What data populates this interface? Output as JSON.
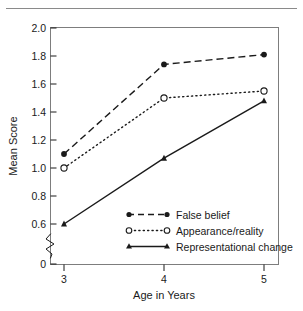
{
  "figure": {
    "top_rule": "horizontal-rule"
  },
  "chart_data": {
    "type": "line",
    "title": "",
    "xlabel": "Age in Years",
    "ylabel": "Mean Score",
    "x": [
      3,
      4,
      5
    ],
    "categories": [
      "3",
      "4",
      "5"
    ],
    "xlim": [
      2.62,
      5.38
    ],
    "ylim": [
      0.52,
      2.0
    ],
    "ytick_labels": [
      "2.0",
      "1.8",
      "1.6",
      "1.4",
      "1.2",
      "1.0",
      "0.8",
      "0.6",
      "0"
    ],
    "ytick_values": [
      2.0,
      1.8,
      1.6,
      1.4,
      1.2,
      1.0,
      0.8,
      0.6,
      0
    ],
    "xtick_labels": [
      "3",
      "4",
      "5"
    ],
    "axis_break": true,
    "axis_break_between": [
      0.6,
      0
    ],
    "grid": false,
    "legend_position": "inside-lower-center",
    "frame": true,
    "series": [
      {
        "name": "False belief",
        "values": [
          1.1,
          1.74,
          1.81
        ],
        "line_style": "dashed",
        "marker": "filled-circle",
        "color": "#1a1a1a"
      },
      {
        "name": "Appearance/reality",
        "values": [
          1.0,
          1.5,
          1.55
        ],
        "line_style": "dotted",
        "marker": "open-circle",
        "color": "#1a1a1a"
      },
      {
        "name": "Representational change",
        "values": [
          0.6,
          1.07,
          1.48
        ],
        "line_style": "solid",
        "marker": "filled-triangle",
        "color": "#1a1a1a"
      }
    ]
  }
}
